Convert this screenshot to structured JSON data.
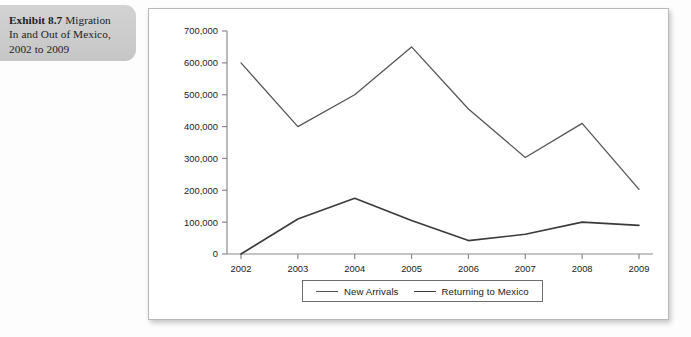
{
  "caption": {
    "lead": "Exhibit 8.7",
    "rest": " Migration In and Out of Mexico, 2002 to 2009",
    "line1_lead": "Exhibit 8.7",
    "line1_rest": " Migration",
    "line2": "In and Out of Mexico,",
    "line3": "2002 to 2009"
  },
  "legend": {
    "items": [
      {
        "label": "New Arrivals",
        "color": "#555555"
      },
      {
        "label": "Returning to Mexico",
        "color": "#3a3a3a"
      }
    ]
  },
  "axis": {
    "y_ticks": [
      "700,000",
      "600,000",
      "500,000",
      "400,000",
      "300,000",
      "200,000",
      "100,000",
      "0"
    ],
    "x_ticks": [
      "2002",
      "2003",
      "2004",
      "2005",
      "2006",
      "2007",
      "2008",
      "2009"
    ]
  },
  "chart_data": {
    "type": "line",
    "title": "Exhibit 8.7 Migration In and Out of Mexico, 2002 to 2009",
    "xlabel": "",
    "ylabel": "",
    "categories": [
      "2002",
      "2003",
      "2004",
      "2005",
      "2006",
      "2007",
      "2008",
      "2009"
    ],
    "x": [
      2002,
      2003,
      2004,
      2005,
      2006,
      2007,
      2008,
      2009
    ],
    "series": [
      {
        "name": "New Arrivals",
        "color": "#555555",
        "values": [
          600000,
          400000,
          500000,
          650000,
          455000,
          303000,
          410000,
          203000
        ]
      },
      {
        "name": "Returning to Mexico",
        "color": "#3a3a3a",
        "values": [
          0,
          110000,
          175000,
          105000,
          42000,
          62000,
          100000,
          90000
        ]
      }
    ],
    "ylim": [
      0,
      700000
    ],
    "ytick_values": [
      0,
      100000,
      200000,
      300000,
      400000,
      500000,
      600000,
      700000
    ],
    "grid": false,
    "legend_position": "bottom"
  }
}
